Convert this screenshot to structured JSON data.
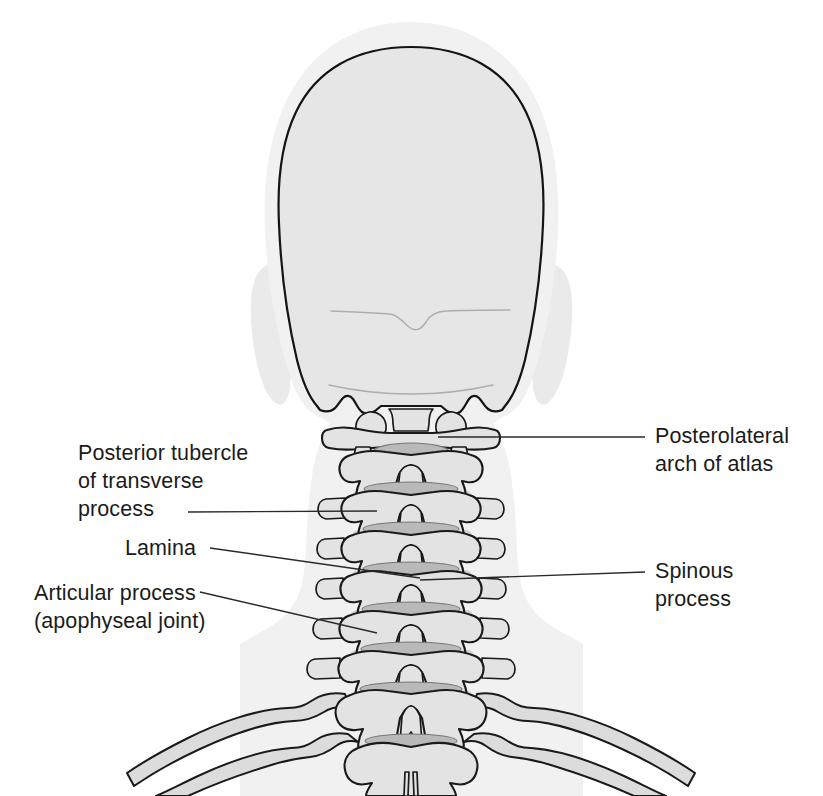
{
  "figure": {
    "background_color": "#ffffff",
    "width": 823,
    "height": 796,
    "view": "posterior",
    "style": "line drawing with grayscale shading"
  },
  "palette": {
    "background": "#ffffff",
    "soft_tissue": "#f1f1f1",
    "ear_tissue": "#eaeaea",
    "skull_fill": "#e6e6e6",
    "bone_fill": "#e3e3e3",
    "bone_outline": "#1a1a1a",
    "disc_shade": "#b9b9b9",
    "vertebral_body_shade": "#d2d2d2",
    "rib_fill": "#dcdcdc",
    "label_text": "#1b1b1b",
    "leader_line": "#2a2a2a",
    "faint_detail_line": "#aeaeae"
  },
  "labels": [
    {
      "id": "posterior-tubercle-of-transverse-process",
      "side": "left",
      "lines": [
        "Posterior tubercle",
        "of transverse",
        "process"
      ],
      "text_x": 78,
      "text_y": 460,
      "anchor": "start",
      "leader": {
        "x1": 188,
        "y1": 512,
        "x2": 377,
        "y2": 511
      }
    },
    {
      "id": "lamina",
      "side": "left",
      "lines": [
        "Lamina"
      ],
      "text_x": 125,
      "text_y": 555,
      "anchor": "start",
      "leader": {
        "x1": 210,
        "y1": 548,
        "x2": 420,
        "y2": 578
      }
    },
    {
      "id": "articular-process-apophyseal-joint",
      "side": "left",
      "lines": [
        "Articular process",
        "(apophyseal joint)"
      ],
      "text_x": 34,
      "text_y": 600,
      "anchor": "start",
      "leader": {
        "x1": 200,
        "y1": 592,
        "x2": 377,
        "y2": 633
      }
    },
    {
      "id": "posterolateral-arch-of-atlas",
      "side": "right",
      "lines": [
        "Posterolateral",
        "arch of atlas"
      ],
      "text_x": 655,
      "text_y": 443,
      "anchor": "start",
      "leader": {
        "x1": 645,
        "y1": 437,
        "x2": 438,
        "y2": 437
      }
    },
    {
      "id": "spinous-process",
      "side": "right",
      "lines": [
        "Spinous",
        "process"
      ],
      "text_x": 655,
      "text_y": 578,
      "anchor": "start",
      "leader": {
        "x1": 645,
        "y1": 572,
        "x2": 420,
        "y2": 580
      }
    }
  ],
  "anatomy": {
    "skull": {
      "name": "occiput / posterior skull",
      "description": "rounded cranial vault seen from behind with occipital margin and mastoid notches"
    },
    "ears": {
      "name": "auricles",
      "count": 2,
      "description": "soft tissue ear silhouettes flanking the skull"
    },
    "soft_tissue": {
      "name": "neck and shoulder soft tissue silhouette"
    },
    "atlas": {
      "name": "atlas (C1)",
      "features": [
        "posterolateral arch",
        "lateral masses",
        "posterior tubercle"
      ]
    },
    "cervical_vertebrae": {
      "name": "cervical vertebrae",
      "levels": [
        "C2",
        "C3",
        "C4",
        "C5",
        "C6",
        "C7"
      ],
      "features": [
        "bifid spinous process",
        "lamina",
        "articular process (apophyseal joint)",
        "posterior tubercle of transverse process"
      ]
    },
    "thoracic_vertebrae": {
      "name": "upper thoracic vertebrae",
      "levels": [
        "T1",
        "T2"
      ]
    },
    "ribs": {
      "name": "first and second ribs",
      "count": 4,
      "description": "paired ribs sweeping laterally and inferiorly"
    }
  }
}
